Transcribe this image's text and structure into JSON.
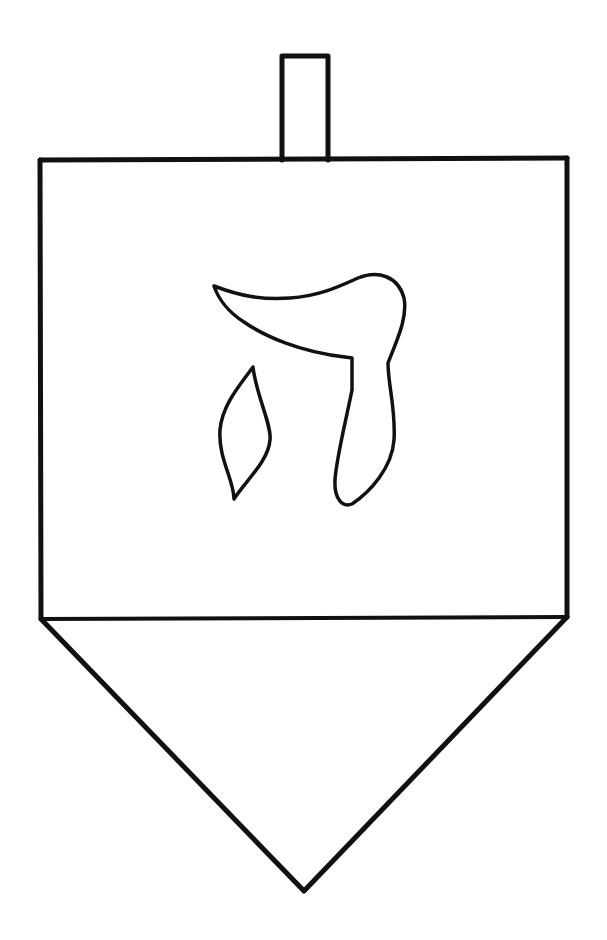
{
  "drawing": {
    "subject": "dreidel",
    "letter": "ה",
    "letter_name": "He",
    "colors": {
      "background": "#ffffff",
      "line": "#111111"
    },
    "line_width": 5,
    "handle": {
      "x": 280,
      "y": 54,
      "width": 49,
      "height": 106
    },
    "body": {
      "top_left": [
        40,
        160
      ],
      "top_right": [
        567,
        158
      ],
      "bottom_left": [
        41,
        619
      ],
      "bottom_right": [
        567,
        617
      ]
    },
    "tip": [
      304,
      892
    ]
  }
}
